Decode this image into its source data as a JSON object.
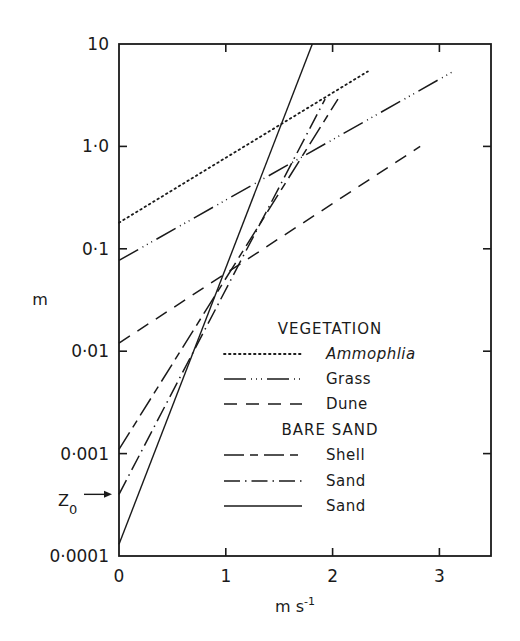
{
  "chart_data": {
    "type": "line",
    "title": "",
    "xlabel": "m s",
    "xlabel_superscript": "-1",
    "ylabel": "m",
    "yscale": "log",
    "xlim": [
      0,
      3.4
    ],
    "ylim": [
      0.0001,
      10
    ],
    "grid": false,
    "x_ticks": [
      "0",
      "1",
      "2",
      "3"
    ],
    "y_ticks": [
      "0.0001",
      "0.001",
      "0.01",
      "0.1",
      "1.0",
      "10"
    ],
    "y_tick_labels": [
      "0·0001",
      "0·001",
      "0·01",
      "0·1",
      "1·0",
      "10"
    ],
    "annotation": {
      "text": "Z",
      "subscript": "0",
      "points_to_y": 0.0004
    },
    "legend": {
      "position": "inside lower right",
      "groups": [
        {
          "header": "VEGETATION",
          "entries": [
            "Ammophlia",
            "Grass",
            "Dune"
          ]
        },
        {
          "header": "BARE SAND",
          "entries": [
            "Shell",
            "Sand",
            "Sand"
          ]
        }
      ]
    },
    "series": [
      {
        "name": "Ammophlia",
        "group": "VEGETATION",
        "style": "dotted",
        "x": [
          0,
          2.33
        ],
        "y": [
          0.18,
          5.4
        ]
      },
      {
        "name": "Grass",
        "group": "VEGETATION",
        "style": "dash-dot-dot",
        "x": [
          0,
          3.13
        ],
        "y": [
          0.077,
          5.4
        ]
      },
      {
        "name": "Dune",
        "group": "VEGETATION",
        "style": "dashed",
        "x": [
          0,
          2.82
        ],
        "y": [
          0.012,
          1.0
        ]
      },
      {
        "name": "Shell",
        "group": "BARE SAND",
        "style": "long-short-dash",
        "x": [
          0,
          2.05
        ],
        "y": [
          0.0011,
          2.9
        ]
      },
      {
        "name": "Sand",
        "group": "BARE SAND",
        "style": "dash-dot",
        "x": [
          0,
          1.93
        ],
        "y": [
          0.0004,
          2.9
        ]
      },
      {
        "name": "Sand",
        "group": "BARE SAND",
        "style": "solid",
        "x": [
          0,
          1.81
        ],
        "y": [
          0.00013,
          10
        ]
      }
    ]
  }
}
